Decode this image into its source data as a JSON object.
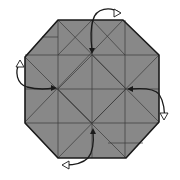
{
  "diagram": {
    "title": "Origami step: octagon with four squash folds",
    "colors": {
      "paper_fill": "#888888",
      "outline": "#1a1a1a",
      "crease": "#3a3a3a",
      "arrow": "#1a1a1a",
      "arrow_hollow_fill": "#ffffff",
      "background": "#ffffff"
    },
    "octagon": [
      [
        58,
        20
      ],
      [
        123,
        20
      ],
      [
        159,
        55
      ],
      [
        159,
        122
      ],
      [
        126,
        158
      ],
      [
        58,
        158
      ],
      [
        25,
        123
      ],
      [
        25,
        57
      ]
    ],
    "creases": [
      [
        58,
        20,
        58,
        158
      ],
      [
        92,
        20,
        92,
        158
      ],
      [
        125,
        20,
        125,
        158
      ],
      [
        25,
        55,
        159,
        55
      ],
      [
        25,
        89,
        159,
        89
      ],
      [
        25,
        123,
        159,
        123
      ],
      [
        58,
        20,
        159,
        122
      ],
      [
        123,
        20,
        25,
        122
      ],
      [
        25,
        57,
        126,
        158
      ],
      [
        159,
        55,
        58,
        158
      ],
      [
        92,
        20,
        58,
        55
      ],
      [
        92,
        20,
        125,
        55
      ],
      [
        92,
        55,
        126,
        89
      ],
      [
        126,
        89,
        92,
        123
      ],
      [
        92,
        123,
        58,
        89
      ],
      [
        58,
        89,
        92,
        55
      ],
      [
        42,
        37,
        58,
        37
      ],
      [
        108,
        143,
        143,
        143
      ]
    ],
    "arrows": [
      {
        "name": "arrow-top",
        "path": "M120,13 C110,6 96,8 93,20 C90,30 91,42 92,50",
        "head_black": [
          92,
          54,
          "down"
        ],
        "head_hollow": [
          121,
          13,
          "right"
        ]
      },
      {
        "name": "arrow-left",
        "path": "M20,62 C14,72 17,84 27,87 C38,90 48,89 54,88",
        "head_black": [
          57,
          88,
          "right"
        ],
        "head_hollow": [
          20,
          60,
          "up"
        ]
      },
      {
        "name": "arrow-right",
        "path": "M130,89 C142,88 154,88 159,94 C164,102 165,112 164,118",
        "head_black": [
          127,
          89,
          "left"
        ],
        "head_hollow": [
          164,
          120,
          "down"
        ]
      },
      {
        "name": "arrow-bottom",
        "path": "M93,131 C94,142 93,152 88,158 C82,164 72,165 65,165",
        "head_black": [
          93,
          128,
          "up"
        ],
        "head_hollow": [
          62,
          165,
          "left"
        ]
      }
    ]
  }
}
